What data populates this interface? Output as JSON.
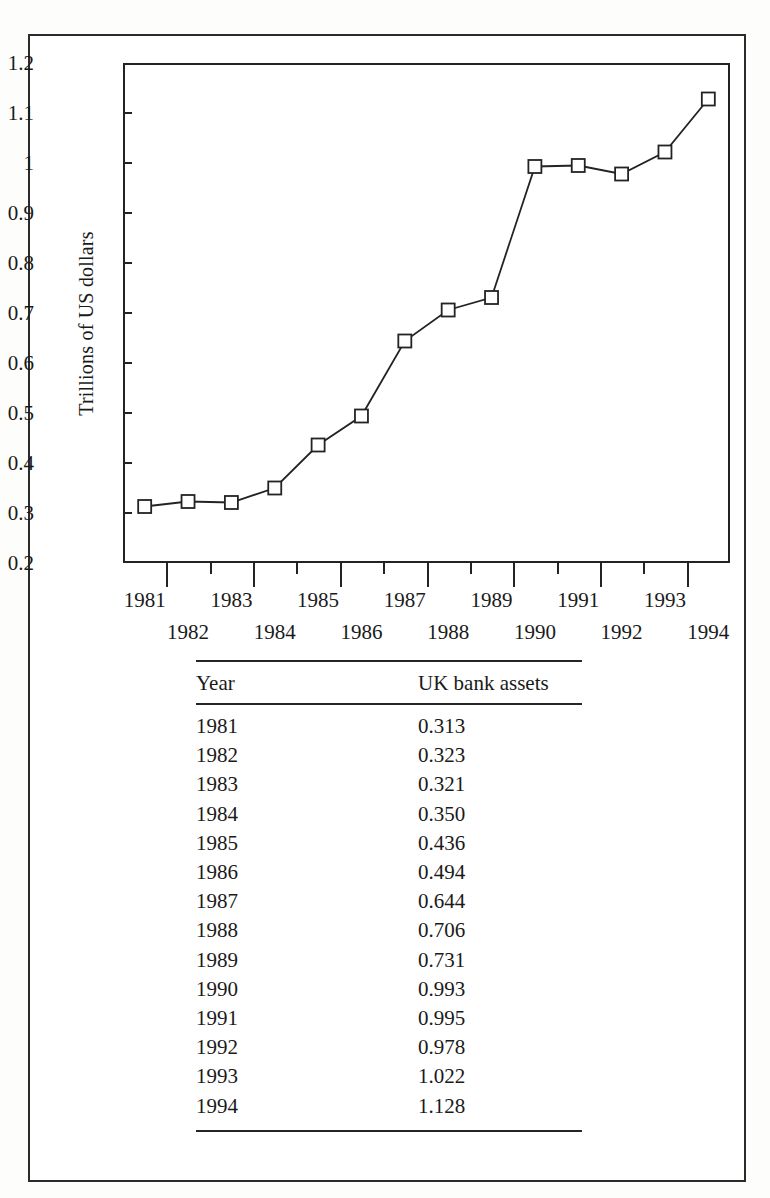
{
  "chart_data": {
    "type": "line",
    "title": "",
    "xlabel": "",
    "ylabel": "Trillions of US dollars",
    "categories": [
      "1981",
      "1982",
      "1983",
      "1984",
      "1985",
      "1986",
      "1987",
      "1988",
      "1989",
      "1990",
      "1991",
      "1992",
      "1993",
      "1994"
    ],
    "values": [
      0.313,
      0.323,
      0.321,
      0.35,
      0.436,
      0.494,
      0.644,
      0.706,
      0.731,
      0.993,
      0.995,
      0.978,
      1.022,
      1.128
    ],
    "series": [
      {
        "name": "UK bank assets",
        "values": [
          0.313,
          0.323,
          0.321,
          0.35,
          0.436,
          0.494,
          0.644,
          0.706,
          0.731,
          0.993,
          0.995,
          0.978,
          1.022,
          1.128
        ]
      }
    ],
    "ylim": [
      0.2,
      1.2
    ],
    "y_ticks": [
      "1.2",
      "1.1",
      "1",
      "0.9",
      "0.8",
      "0.7",
      "0.6",
      "0.5",
      "0.4",
      "0.3",
      "0.2"
    ],
    "y_tick_values": [
      1.2,
      1.1,
      1.0,
      0.9,
      0.8,
      0.7,
      0.6,
      0.5,
      0.4,
      0.3,
      0.2
    ],
    "x_tick_labels_top": [
      "1981",
      "1983",
      "1985",
      "1987",
      "1989",
      "1991",
      "1993"
    ],
    "x_tick_labels_bottom": [
      "1982",
      "1984",
      "1986",
      "1988",
      "1990",
      "1992",
      "1994"
    ],
    "grid": false,
    "legend": "none",
    "marker": "open-square",
    "line_color": "#232323",
    "marker_fill": "#ffffff",
    "marker_edge": "#232323"
  },
  "axis": {
    "y_title": "Trillions of US dollars"
  },
  "table": {
    "columns": [
      "Year",
      "UK bank assets"
    ],
    "rows": [
      {
        "year": "1981",
        "value": "0.313"
      },
      {
        "year": "1982",
        "value": "0.323"
      },
      {
        "year": "1983",
        "value": "0.321"
      },
      {
        "year": "1984",
        "value": "0.350"
      },
      {
        "year": "1985",
        "value": "0.436"
      },
      {
        "year": "1986",
        "value": "0.494"
      },
      {
        "year": "1987",
        "value": "0.644"
      },
      {
        "year": "1988",
        "value": "0.706"
      },
      {
        "year": "1989",
        "value": "0.731"
      },
      {
        "year": "1990",
        "value": "0.993"
      },
      {
        "year": "1991",
        "value": "0.995"
      },
      {
        "year": "1992",
        "value": "0.978"
      },
      {
        "year": "1993",
        "value": "1.022"
      },
      {
        "year": "1994",
        "value": "1.128"
      }
    ]
  }
}
